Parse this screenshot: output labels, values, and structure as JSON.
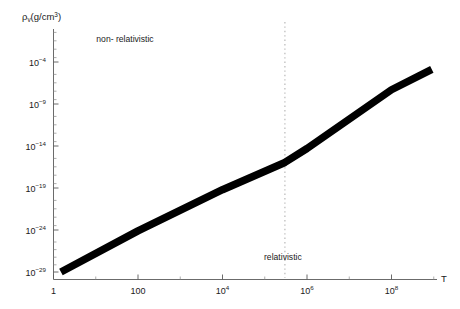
{
  "chart_data": {
    "type": "line",
    "title": "",
    "xlabel": "T",
    "ylabel": "ρᵥ(g/cm³)",
    "xscale": "log",
    "yscale": "log",
    "xlim": [
      1,
      1000000000
    ],
    "ylim": [
      1e-31,
      0.001
    ],
    "grid": false,
    "legend": null,
    "x_ticks": [
      {
        "value": 1,
        "label": "1",
        "mantissa": "1",
        "exponent": ""
      },
      {
        "value": 100,
        "label": "100",
        "mantissa": "100",
        "exponent": ""
      },
      {
        "value": 10000,
        "label": "10^4",
        "mantissa": "10",
        "exponent": "4"
      },
      {
        "value": 1000000,
        "label": "10^6",
        "mantissa": "10",
        "exponent": "6"
      },
      {
        "value": 100000000,
        "label": "10^8",
        "mantissa": "10",
        "exponent": "8"
      }
    ],
    "y_ticks": [
      {
        "value": 0.0001,
        "label": "10^-4",
        "mantissa": "10",
        "exponent": "-4"
      },
      {
        "value": 1e-09,
        "label": "10^-9",
        "mantissa": "10",
        "exponent": "-9"
      },
      {
        "value": 1e-14,
        "label": "10^-14",
        "mantissa": "10",
        "exponent": "-14"
      },
      {
        "value": 1e-19,
        "label": "10^-19",
        "mantissa": "10",
        "exponent": "-19"
      },
      {
        "value": 1e-24,
        "label": "10^-24",
        "mantissa": "10",
        "exponent": "-24"
      },
      {
        "value": 1e-29,
        "label": "10^-29",
        "mantissa": "10",
        "exponent": "-29"
      }
    ],
    "series": [
      {
        "name": "rho_v",
        "color": "#000000",
        "linewidth_px": 7.5,
        "points": [
          {
            "x": 1.5,
            "y": 1e-29
          },
          {
            "x": 100,
            "y": 7.9e-25
          },
          {
            "x": 10000,
            "y": 6.3e-20
          },
          {
            "x": 300000,
            "y": 1.1e-16
          },
          {
            "x": 1000000,
            "y": 5e-15
          },
          {
            "x": 100000000,
            "y": 5e-08
          },
          {
            "x": 900000000,
            "y": 1.3e-05
          }
        ]
      }
    ],
    "annotations": [
      {
        "name": "non-relativistic-label",
        "text": "non- relativistic",
        "x_px": 125,
        "y_px": 42
      },
      {
        "name": "relativistic-label",
        "text": "relativistic",
        "x_px": 264,
        "y_px": 260
      }
    ],
    "reference_lines": [
      {
        "name": "relativistic-boundary",
        "orientation": "vertical",
        "x_value": 300000,
        "style": "dotted",
        "color": "#b8b8b8"
      }
    ],
    "axis_label_x_position": {
      "x_px": 444,
      "y_px": 282
    },
    "axis_label_y_position": {
      "x_px": 22,
      "y_px": 20
    }
  }
}
